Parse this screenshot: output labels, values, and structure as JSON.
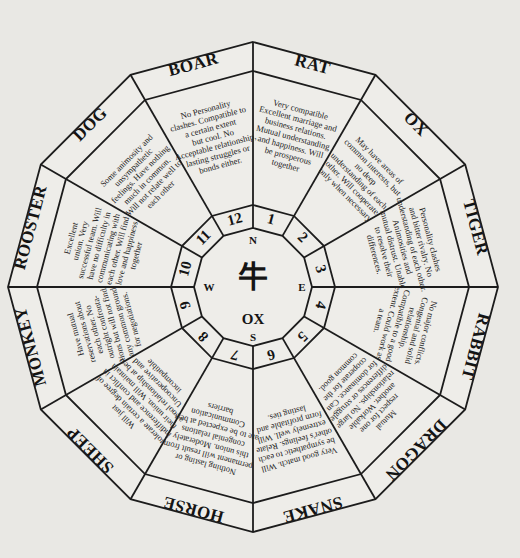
{
  "wheel": {
    "center": {
      "x": 253,
      "y": 287
    },
    "radii": {
      "outer": 245,
      "label_inner": 216,
      "hub_outer": 82,
      "hub_inner": 59
    },
    "background": "#e9e8e4",
    "line_color": "#1c1c1c"
  },
  "hub": {
    "character": "牛",
    "name": "OX",
    "compass": {
      "north": "N",
      "east": "E",
      "south": "S",
      "west": "W"
    }
  },
  "segments": [
    {
      "number": "1",
      "sign": "RAT",
      "text": [
        "Very compatible",
        "Excellent marriage and",
        "business relations.",
        "Mutual understanding",
        "and happiness. Will",
        "be prosperous",
        "together"
      ]
    },
    {
      "number": "2",
      "sign": "OX",
      "text": [
        "May have areas of",
        "common interests, but",
        "no deep",
        "understanding of each",
        "other. Will cooperate",
        "only when necessary"
      ]
    },
    {
      "number": "3",
      "sign": "TIGER",
      "text": [
        "Personality clashes",
        "and bitter rivalry. No",
        "understanding of each other.",
        "Animosities and",
        "mutual distrust. Unable",
        "to resolve their",
        "differences."
      ]
    },
    {
      "number": "4",
      "sign": "RABBIT",
      "text": [
        "No major conflicts.",
        "Congenial and solid",
        "relationship.",
        "Compatible to a good",
        "extent. Could work as",
        "a team."
      ]
    },
    {
      "number": "5",
      "sign": "DRAGON",
      "text": [
        "Mutual",
        "respect for one",
        "another. Workable",
        "relationships. No large",
        "differences or struggle",
        "for dominance. Can",
        "cooperate for the",
        "common good."
      ]
    },
    {
      "number": "6",
      "sign": "SNAKE",
      "text": [
        "Very good match. Will",
        "be sympathetic to each",
        "other's feelings. Relate",
        "extremely well. Will",
        "form profitable and",
        "lasting ties."
      ]
    },
    {
      "number": "7",
      "sign": "HORSE",
      "text": [
        "Nothing lasting or",
        "permanent will result from",
        "this union. Moderately",
        "congenial relations",
        "are to be expected at best.",
        "Communication",
        "barriers"
      ]
    },
    {
      "number": "8",
      "sign": "SHEEP",
      "text": [
        "Will just",
        "tolerate a certain degree of",
        "indifference and conflict in",
        "their union. Will maintain",
        "a cool relationship at best.",
        "Uncooperative and",
        "incompatible"
      ]
    },
    {
      "number": "9",
      "sign": "MONKEY",
      "text": [
        "Have mutual",
        "reservations about",
        "each other. No",
        "outright confronta-",
        "tions but will not find",
        "any common ground",
        "for negotiations."
      ]
    },
    {
      "number": "10",
      "sign": "ROOSTER",
      "text": [
        "Excellent",
        "union. Very",
        "successful team. Will",
        "have no difficulty in",
        "communicating with",
        "each other. Will find",
        "love and happiness",
        "together"
      ]
    },
    {
      "number": "11",
      "sign": "DOG",
      "text": [
        "Some animosity and",
        "unsympathetic",
        "feelings. Have nothing",
        "much in common.",
        "Will not relate well to",
        "each other"
      ]
    },
    {
      "number": "12",
      "sign": "BOAR",
      "text": [
        "No Personality",
        "clashes. Compatible to",
        "a certain extent",
        "but cool. No",
        "Acceptable relationship,",
        "lasting struggles or",
        "bonds either."
      ]
    }
  ]
}
